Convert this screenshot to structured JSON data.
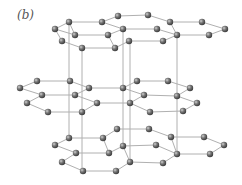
{
  "figure": {
    "label": "(b)",
    "colors": {
      "atom": "#5a5a5a",
      "atom_highlight": "#c8c8c8",
      "bond": "#b0b0b0",
      "background": "#ffffff"
    },
    "atom_radius": 3.2,
    "layers": [
      {
        "name": "top",
        "atoms": [
          [
            69,
            22
          ],
          [
            102,
            22
          ],
          [
            118,
            16
          ],
          [
            148,
            15
          ],
          [
            170,
            22
          ],
          [
            202,
            22
          ],
          [
            225,
            29
          ],
          [
            55,
            29
          ],
          [
            75,
            35
          ],
          [
            108,
            35
          ],
          [
            123,
            29
          ],
          [
            157,
            29
          ],
          [
            177,
            35
          ],
          [
            209,
            35
          ],
          [
            62,
            41
          ],
          [
            82,
            48
          ],
          [
            115,
            48
          ],
          [
            129,
            41
          ],
          [
            163,
            41
          ]
        ],
        "bonds": [
          [
            7,
            0
          ],
          [
            0,
            1
          ],
          [
            1,
            2
          ],
          [
            2,
            3
          ],
          [
            3,
            4
          ],
          [
            4,
            5
          ],
          [
            5,
            6
          ],
          [
            6,
            13
          ],
          [
            13,
            12
          ],
          [
            12,
            4
          ],
          [
            12,
            11
          ],
          [
            11,
            10
          ],
          [
            10,
            1
          ],
          [
            10,
            9
          ],
          [
            9,
            8
          ],
          [
            8,
            0
          ],
          [
            8,
            7
          ],
          [
            7,
            14
          ],
          [
            14,
            15
          ],
          [
            15,
            16
          ],
          [
            16,
            9
          ],
          [
            16,
            17
          ],
          [
            17,
            18
          ],
          [
            18,
            12
          ]
        ]
      },
      {
        "name": "middle",
        "atoms": [
          [
            37,
            81
          ],
          [
            70,
            81
          ],
          [
            20,
            88
          ],
          [
            42,
            95
          ],
          [
            75,
            95
          ],
          [
            89,
            88
          ],
          [
            27,
            103
          ],
          [
            48,
            112
          ],
          [
            82,
            112
          ],
          [
            97,
            103
          ],
          [
            123,
            88
          ],
          [
            137,
            81
          ],
          [
            168,
            81
          ],
          [
            130,
            103
          ],
          [
            144,
            95
          ],
          [
            177,
            96
          ],
          [
            150,
            112
          ],
          [
            183,
            111
          ],
          [
            190,
            88
          ],
          [
            197,
            103
          ]
        ],
        "bonds": [
          [
            2,
            0
          ],
          [
            0,
            1
          ],
          [
            1,
            5
          ],
          [
            2,
            3
          ],
          [
            3,
            4
          ],
          [
            4,
            5
          ],
          [
            3,
            6
          ],
          [
            6,
            7
          ],
          [
            7,
            8
          ],
          [
            8,
            9
          ],
          [
            9,
            4
          ],
          [
            5,
            10
          ],
          [
            10,
            11
          ],
          [
            11,
            12
          ],
          [
            12,
            18
          ],
          [
            10,
            14
          ],
          [
            14,
            15
          ],
          [
            15,
            18
          ],
          [
            9,
            13
          ],
          [
            13,
            14
          ],
          [
            13,
            16
          ],
          [
            16,
            17
          ],
          [
            17,
            19
          ],
          [
            19,
            15
          ]
        ]
      },
      {
        "name": "bottom",
        "atoms": [
          [
            69,
            138
          ],
          [
            103,
            138
          ],
          [
            117,
            129
          ],
          [
            55,
            145
          ],
          [
            76,
            153
          ],
          [
            109,
            153
          ],
          [
            123,
            146
          ],
          [
            62,
            162
          ],
          [
            83,
            171
          ],
          [
            116,
            171
          ],
          [
            130,
            162
          ],
          [
            149,
            129
          ],
          [
            171,
            137
          ],
          [
            204,
            137
          ],
          [
            224,
            145
          ],
          [
            156,
            145
          ],
          [
            177,
            154
          ],
          [
            210,
            154
          ],
          [
            163,
            163
          ]
        ],
        "bonds": [
          [
            3,
            0
          ],
          [
            0,
            1
          ],
          [
            1,
            5
          ],
          [
            1,
            2
          ],
          [
            2,
            11
          ],
          [
            11,
            12
          ],
          [
            12,
            13
          ],
          [
            13,
            14
          ],
          [
            14,
            17
          ],
          [
            17,
            16
          ],
          [
            16,
            12
          ],
          [
            3,
            4
          ],
          [
            4,
            5
          ],
          [
            5,
            6
          ],
          [
            6,
            15
          ],
          [
            15,
            16
          ],
          [
            4,
            7
          ],
          [
            7,
            8
          ],
          [
            8,
            9
          ],
          [
            9,
            10
          ],
          [
            10,
            6
          ],
          [
            10,
            18
          ],
          [
            18,
            16
          ]
        ]
      }
    ],
    "vertical_lines": [
      [
        69,
        22,
        69,
        138
      ],
      [
        82,
        48,
        82,
        171
      ],
      [
        123,
        29,
        123,
        146
      ],
      [
        130,
        41,
        130,
        162
      ],
      [
        177,
        35,
        177,
        154
      ]
    ]
  }
}
